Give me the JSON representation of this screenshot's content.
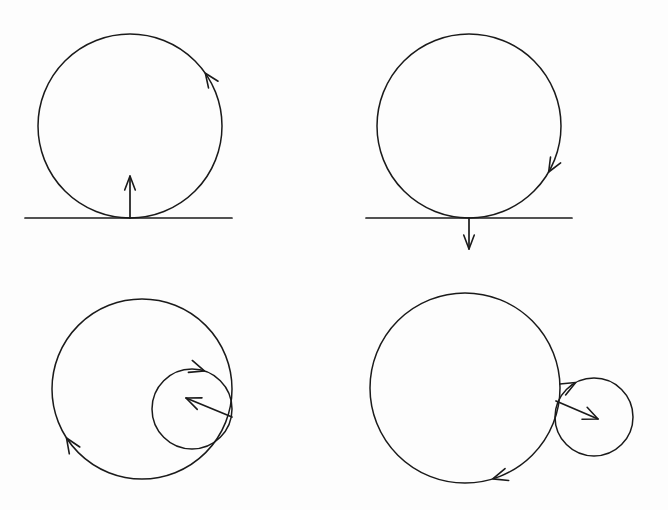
{
  "figure": {
    "background_color": "#fdfdfd",
    "stroke_color": "#1a1a1a",
    "width": 668,
    "height": 510,
    "panel_count": 4,
    "panel_layout": "2x2 grid",
    "style": "hand-drawn line art, no labels"
  },
  "panels": [
    {
      "id": "top-left",
      "name": "circle-rolling-on-line-ccw",
      "description": "Circle tangent to a horizontal ground line with an upward velocity vector at the contact point and a counterclockwise rotation arrowhead on the right arc.",
      "circle": {
        "cx": 130,
        "cy": 126,
        "r": 92
      },
      "ground_line": {
        "x1": 25,
        "y1": 218,
        "x2": 232,
        "y2": 218
      },
      "contact_point": {
        "x": 130,
        "y": 218
      },
      "vector": {
        "name": "upward-velocity-vector",
        "from": {
          "x": 130,
          "y": 218
        },
        "to": {
          "x": 130,
          "y": 176
        },
        "direction": "up"
      },
      "rotation": {
        "sense": "counterclockwise",
        "arrow_position_deg": 35,
        "arrow_direction": "up"
      }
    },
    {
      "id": "top-right",
      "name": "circle-rolling-on-line-cw",
      "description": "Circle tangent to a horizontal ground line with a downward velocity vector below the contact point and a clockwise rotation arrowhead on the right arc.",
      "circle": {
        "cx": 469,
        "cy": 126,
        "r": 92
      },
      "ground_line": {
        "x1": 366,
        "y1": 218,
        "x2": 572,
        "y2": 218
      },
      "contact_point": {
        "x": 469,
        "y": 218
      },
      "vector": {
        "name": "downward-velocity-vector",
        "from": {
          "x": 469,
          "y": 218
        },
        "to": {
          "x": 469,
          "y": 249
        },
        "direction": "down"
      },
      "rotation": {
        "sense": "clockwise",
        "arrow_position_deg": 330,
        "arrow_direction": "down"
      }
    },
    {
      "id": "bottom-left",
      "name": "internally-tangent-circles",
      "description": "Large circle with a smaller circle internally tangent on the right side; a vector runs from the tangent point inward toward the small circle center. Rotation arrowheads appear on the large circle lower-left arc and on the small circle upper arc.",
      "large_circle": {
        "cx": 142,
        "cy": 389,
        "r": 90
      },
      "small_circle": {
        "cx": 192,
        "cy": 409,
        "r": 40
      },
      "tangency": "internal",
      "tangent_point": {
        "x": 232,
        "y": 417
      },
      "vector": {
        "name": "inward-velocity-vector",
        "from": {
          "x": 232,
          "y": 417
        },
        "to": {
          "x": 186,
          "y": 398
        },
        "direction": "up-left"
      },
      "rotation": {
        "large_sense": "clockwise",
        "small_sense": "clockwise"
      }
    },
    {
      "id": "bottom-right",
      "name": "externally-tangent-circles",
      "description": "Large circle with a smaller circle externally tangent on the right side; a vector runs from the tangent point rightward into the small circle. Rotation arrowheads appear on the large circle lower arc and on the small circle upper-left arc.",
      "large_circle": {
        "cx": 465,
        "cy": 388,
        "r": 95
      },
      "small_circle": {
        "cx": 594,
        "cy": 417,
        "r": 39
      },
      "tangency": "external",
      "tangent_point": {
        "x": 556,
        "y": 401
      },
      "vector": {
        "name": "outward-velocity-vector",
        "from": {
          "x": 556,
          "y": 401
        },
        "to": {
          "x": 598,
          "y": 419
        },
        "direction": "right-down"
      },
      "rotation": {
        "large_sense": "clockwise",
        "small_sense": "clockwise"
      }
    }
  ]
}
